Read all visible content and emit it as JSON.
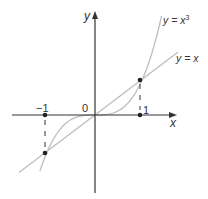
{
  "chart_data": {
    "type": "line",
    "title": "",
    "xlabel": "x",
    "ylabel": "y",
    "series": [
      {
        "name": "y = x^3",
        "label": "y = x³",
        "x": [
          -1.16,
          -1,
          -0.5,
          0,
          0.5,
          1,
          1.4
        ],
        "values": [
          -1.56,
          -1,
          -0.125,
          0,
          0.125,
          1,
          2.74
        ]
      },
      {
        "name": "y = x",
        "label": "y = x",
        "x": [
          -1.6,
          -1,
          0,
          1,
          1.75
        ],
        "values": [
          -1.6,
          -1,
          0,
          1,
          1.75
        ]
      }
    ],
    "marked_points": [
      [
        -1,
        0
      ],
      [
        1,
        0
      ],
      [
        1,
        1
      ],
      [
        -1,
        -1
      ]
    ],
    "tick_labels": {
      "x": [
        "-1",
        "0",
        "1"
      ]
    },
    "grid": false,
    "colors": {
      "axes": "#333333",
      "curves": "#bdbdbd",
      "points": "#222222"
    }
  },
  "labels": {
    "y_axis": "y",
    "x_axis": "x",
    "origin": "0",
    "tick_neg1": "−1",
    "tick_1": "1",
    "cube_prefix": "y = x",
    "cube_sup": "3",
    "line_label": "y = x"
  }
}
